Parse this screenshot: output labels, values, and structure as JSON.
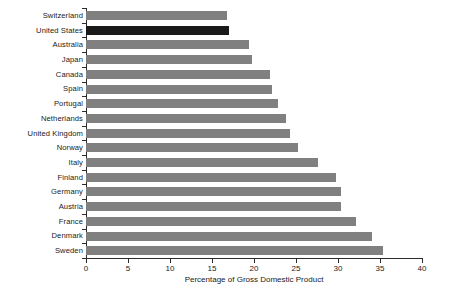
{
  "chart_data": {
    "type": "bar",
    "orientation": "horizontal",
    "title": "",
    "subtitle": "",
    "xlabel": "Percentage of Gross Domestic Product",
    "ylabel": "",
    "xlim": [
      0,
      40
    ],
    "xticks": [
      0,
      5,
      10,
      15,
      20,
      25,
      30,
      35,
      40
    ],
    "grid": false,
    "legend": null,
    "categories": [
      "Switzerland",
      "United States",
      "Australia",
      "Japan",
      "Canada",
      "Spain",
      "Portugal",
      "Netherlands",
      "United Kingdom",
      "Norway",
      "Italy",
      "Finland",
      "Germany",
      "Austria",
      "France",
      "Denmark",
      "Sweden"
    ],
    "values": [
      16.8,
      17.0,
      19.4,
      19.8,
      21.9,
      22.1,
      22.9,
      23.8,
      24.3,
      25.2,
      27.6,
      29.8,
      30.4,
      30.4,
      32.1,
      34.1,
      35.3
    ],
    "highlighted_category": "United States",
    "colors": {
      "bar": "#808080",
      "highlight": "#1a1a1a",
      "axis": "#2b2b2b",
      "text": "#1a1a1a",
      "background": "#ffffff"
    }
  }
}
